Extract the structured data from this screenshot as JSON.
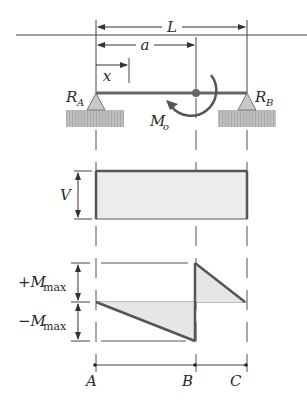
{
  "diagram": {
    "type": "beam-shear-moment-diagram",
    "beam": {
      "labels": {
        "length": "L",
        "moment_position": "a",
        "position": "x",
        "left_reaction": "R",
        "left_reaction_sub": "A",
        "right_reaction": "R",
        "right_reaction_sub": "B",
        "applied_moment": "M",
        "applied_moment_sub": "o"
      }
    },
    "shear_diagram": {
      "label": "V"
    },
    "moment_diagram": {
      "positive_label_prefix": "+M",
      "negative_label_prefix": "−M",
      "label_sub": "max"
    },
    "axis_points": [
      "A",
      "B",
      "C"
    ],
    "colors": {
      "line": "#555555",
      "fill": "#e6e6e6",
      "support": "#c8c8c8",
      "ground": "#b5b5b5",
      "text": "#2a2a2a"
    }
  }
}
